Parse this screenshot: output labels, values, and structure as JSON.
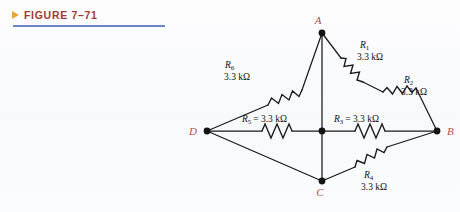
{
  "caption": {
    "marker_icon": "triangle-right-icon",
    "text": "FIGURE 7–71",
    "color": "#9c3b32",
    "marker_color": "#e8a33d",
    "rule_color": "#6a86c4"
  },
  "circuit": {
    "type": "bridge-network",
    "node_label_color": "#b5514a",
    "wire_color": "#1a1a1a",
    "nodes": [
      {
        "id": "A",
        "label": "A",
        "x": 322,
        "y": 33
      },
      {
        "id": "B",
        "label": "B",
        "x": 437,
        "y": 131
      },
      {
        "id": "C",
        "label": "C",
        "x": 322,
        "y": 181
      },
      {
        "id": "D",
        "label": "D",
        "x": 207,
        "y": 131
      },
      {
        "id": "M",
        "label": "",
        "x": 322,
        "y": 131
      }
    ],
    "resistors": [
      {
        "id": "R1",
        "symbol": "R",
        "subscript": "1",
        "value": "3.3 kΩ",
        "label": "R₁ 3.3 kΩ",
        "from": "A",
        "to": "B",
        "separator": ""
      },
      {
        "id": "R2",
        "symbol": "R",
        "subscript": "2",
        "value": "3.3 kΩ",
        "label": "R₂ 3.3 kΩ",
        "from": "A",
        "to": "B",
        "separator": ""
      },
      {
        "id": "R3",
        "symbol": "R",
        "subscript": "3",
        "value": "3.3 kΩ",
        "label": "R₃ = 3.3 kΩ",
        "from": "M",
        "to": "B",
        "separator": "="
      },
      {
        "id": "R4",
        "symbol": "R",
        "subscript": "4",
        "value": "3.3 kΩ",
        "label": "R₄ 3.3 kΩ",
        "from": "C",
        "to": "B",
        "separator": ""
      },
      {
        "id": "R5",
        "symbol": "R",
        "subscript": "5",
        "value": "3.3 kΩ",
        "label": "R₅ = 3.3 kΩ",
        "from": "D",
        "to": "M",
        "separator": "="
      },
      {
        "id": "R6",
        "symbol": "R",
        "subscript": "6",
        "value": "3.3 kΩ",
        "label": "R₆ 3.3 kΩ",
        "from": "D",
        "to": "A",
        "separator": ""
      }
    ],
    "labels": {
      "R1_sym": "R",
      "R1_sub": "1",
      "R1_val": "3.3 kΩ",
      "R2_sym": "R",
      "R2_sub": "2",
      "R2_val": "3.3 kΩ",
      "R3_sym": "R",
      "R3_sub": "3",
      "R3_val": "= 3.3 kΩ",
      "R4_sym": "R",
      "R4_sub": "4",
      "R4_val": "3.3 kΩ",
      "R5_sym": "R",
      "R5_sub": "5",
      "R5_val": "= 3.3 kΩ",
      "R6_sym": "R",
      "R6_sub": "6",
      "R6_val": "3.3 kΩ",
      "node_A": "A",
      "node_B": "B",
      "node_C": "C",
      "node_D": "D"
    }
  }
}
